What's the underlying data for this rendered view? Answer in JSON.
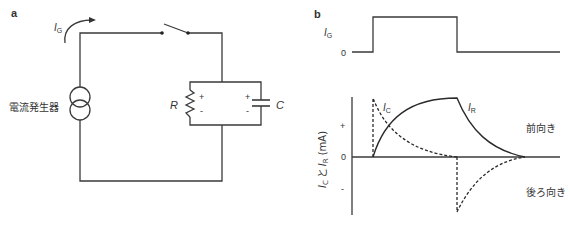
{
  "panel_a": {
    "label": "a",
    "current_label": "I",
    "current_sub": "G",
    "source_label": "電流発生器",
    "resistor_label": "R",
    "capacitor_label": "C",
    "plus": "+",
    "minus": "-"
  },
  "panel_b": {
    "label": "b",
    "top_trace": {
      "ylabel": "I",
      "ylabel_sub": "G",
      "zero_label": "0"
    },
    "bottom_plot": {
      "ylabel_ic": "I",
      "ylabel_ic_sub": "C",
      "ylabel_and": "と",
      "ylabel_ir": "I",
      "ylabel_ir_sub": "R",
      "ylabel_unit": "(mA)",
      "plus_tick": "+",
      "zero_tick": "0",
      "minus_tick": "-",
      "ic_curve_label": "I",
      "ic_curve_sub": "C",
      "ir_curve_label": "I",
      "ir_curve_sub": "R",
      "forward_label": "前向き",
      "backward_label": "後ろ向き"
    }
  },
  "colors": {
    "line": "#3a3a3a",
    "text": "#333333"
  }
}
